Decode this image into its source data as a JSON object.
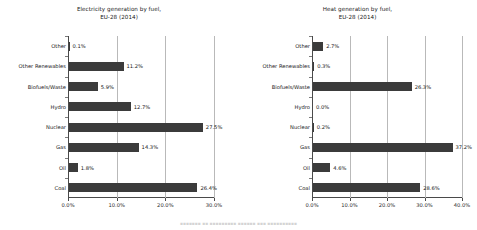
{
  "figure": {
    "footer_caption": "▪▪▪▪▪▪▪  ▪▪  ▪▪▪▪▪▪▪▪▪   ▪▪▪▪▪▪  ▪▪▪   ▪▪▪▪▪▪▪▪▪▪"
  },
  "charts": [
    {
      "id": "electricity-generation-chart",
      "title": "Electricity generation by fuel,\nEU-28 (2014)"
    },
    {
      "id": "heat-generation-chart",
      "title": "Heat generation by fuel,\nEU-28 (2014)"
    }
  ],
  "chart_data": [
    {
      "type": "bar",
      "orientation": "horizontal",
      "title": "Electricity generation by fuel, EU-28 (2014)",
      "xlabel": "",
      "ylabel": "",
      "xlim": [
        0,
        30
      ],
      "xticks": [
        0,
        10,
        20,
        30
      ],
      "xtick_labels": [
        "0.0%",
        "10.0%",
        "20.0%",
        "30.0%"
      ],
      "grid": true,
      "grid_axis": "x",
      "legend": false,
      "bar_color": "#3b3b3b",
      "categories": [
        "Other",
        "Other Renewables",
        "Biofuels/Waste",
        "Hydro",
        "Nuclear",
        "Gas",
        "Oil",
        "Coal"
      ],
      "values": [
        0.1,
        11.2,
        5.9,
        12.7,
        27.5,
        14.3,
        1.8,
        26.4
      ],
      "data_labels": [
        "0.1%",
        "11.2%",
        "5.9%",
        "12.7%",
        "27.5%",
        "14.3%",
        "1.8%",
        "26.4%"
      ]
    },
    {
      "type": "bar",
      "orientation": "horizontal",
      "title": "Heat generation by fuel, EU-28 (2014)",
      "xlabel": "",
      "ylabel": "",
      "xlim": [
        0,
        40
      ],
      "xticks": [
        0,
        10,
        20,
        30,
        40
      ],
      "xtick_labels": [
        "0.0%",
        "10.0%",
        "20.0%",
        "30.0%",
        "40.0%"
      ],
      "grid": true,
      "grid_axis": "x",
      "legend": false,
      "bar_color": "#3b3b3b",
      "categories": [
        "Other",
        "Other Renewables",
        "Biofuels/Waste",
        "Hydro",
        "Nuclear",
        "Gas",
        "Oil",
        "Coal"
      ],
      "values": [
        2.7,
        0.3,
        26.3,
        0.0,
        0.2,
        37.2,
        4.6,
        28.6
      ],
      "data_labels": [
        "2.7%",
        "0.3%",
        "26.3%",
        "0.0%",
        "0.2%",
        "37.2%",
        "4.6%",
        "28.6%"
      ]
    }
  ]
}
